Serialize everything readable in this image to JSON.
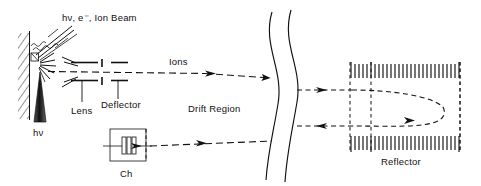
{
  "figure": {
    "background_color": "#ffffff",
    "ink_color": "#111111",
    "width": 481,
    "height": 186
  },
  "labels": {
    "source_beam": "hν, e⁻, Ion Beam",
    "photon_input": "hν",
    "lens": "Lens",
    "deflector": "Deflector",
    "ions": "Ions",
    "drift_region": "Drift Region",
    "chopper": "Ch",
    "reflector": "Reflector"
  },
  "components": [
    {
      "name": "sample-wall",
      "label": "",
      "type": "hatched-wall",
      "description": "Hatched vertical wall holding the sample target"
    },
    {
      "name": "sample-target",
      "label": "",
      "type": "square",
      "description": "Small square sample on the wall where beams strike"
    },
    {
      "name": "incoming-beam",
      "label": "hν, e⁻, Ion Beam",
      "type": "arrow-bundle",
      "description": "Bundle of incident rays arriving at the sample from upper right"
    },
    {
      "name": "photon-arrow",
      "label": "hν",
      "type": "tapered-arrow",
      "description": "Shaded tapered arrow pointing up into the sample"
    },
    {
      "name": "emission-burst",
      "label": "",
      "type": "radiating-lines",
      "description": "Radiating lines showing desorbed ions leaving the sample"
    },
    {
      "name": "ion-lens",
      "label": "Lens",
      "type": "electrode-pair",
      "description": "Pair of horizontal lens plates above and below the beam axis"
    },
    {
      "name": "ion-deflector",
      "label": "Deflector",
      "type": "electrode-pair",
      "description": "Pair of deflector electrodes downstream of the lens"
    },
    {
      "name": "drift-tube",
      "label": "Drift Region",
      "type": "break-curves",
      "description": "Field-free drift region drawn with two S-shaped break curves"
    },
    {
      "name": "chopper",
      "label": "Ch",
      "type": "boxed-plates",
      "description": "Beam chopper box containing vertical plates"
    },
    {
      "name": "reflector",
      "label": "Reflector",
      "type": "grid-box",
      "description": "Ion mirror with comb grids on top and bottom and internal dashed grid planes"
    }
  ],
  "beam_paths": [
    {
      "name": "ion-beam-forward",
      "label": "Ions",
      "style": "dashed",
      "direction": "left-to-right",
      "description": "Primary ion beam travelling from source through lens and deflector into the drift region"
    },
    {
      "name": "reflected-beam-upper",
      "label": "",
      "style": "dashed",
      "direction": "left-to-right",
      "description": "Beam entering the reflector and curving back"
    },
    {
      "name": "reflected-beam-lower",
      "label": "",
      "style": "dashed",
      "direction": "right-to-left",
      "description": "Reflected beam returning toward the chopper"
    },
    {
      "name": "chopper-beam",
      "label": "",
      "style": "dashed",
      "direction": "right-to-left",
      "description": "Return beam arriving at the chopper"
    }
  ]
}
